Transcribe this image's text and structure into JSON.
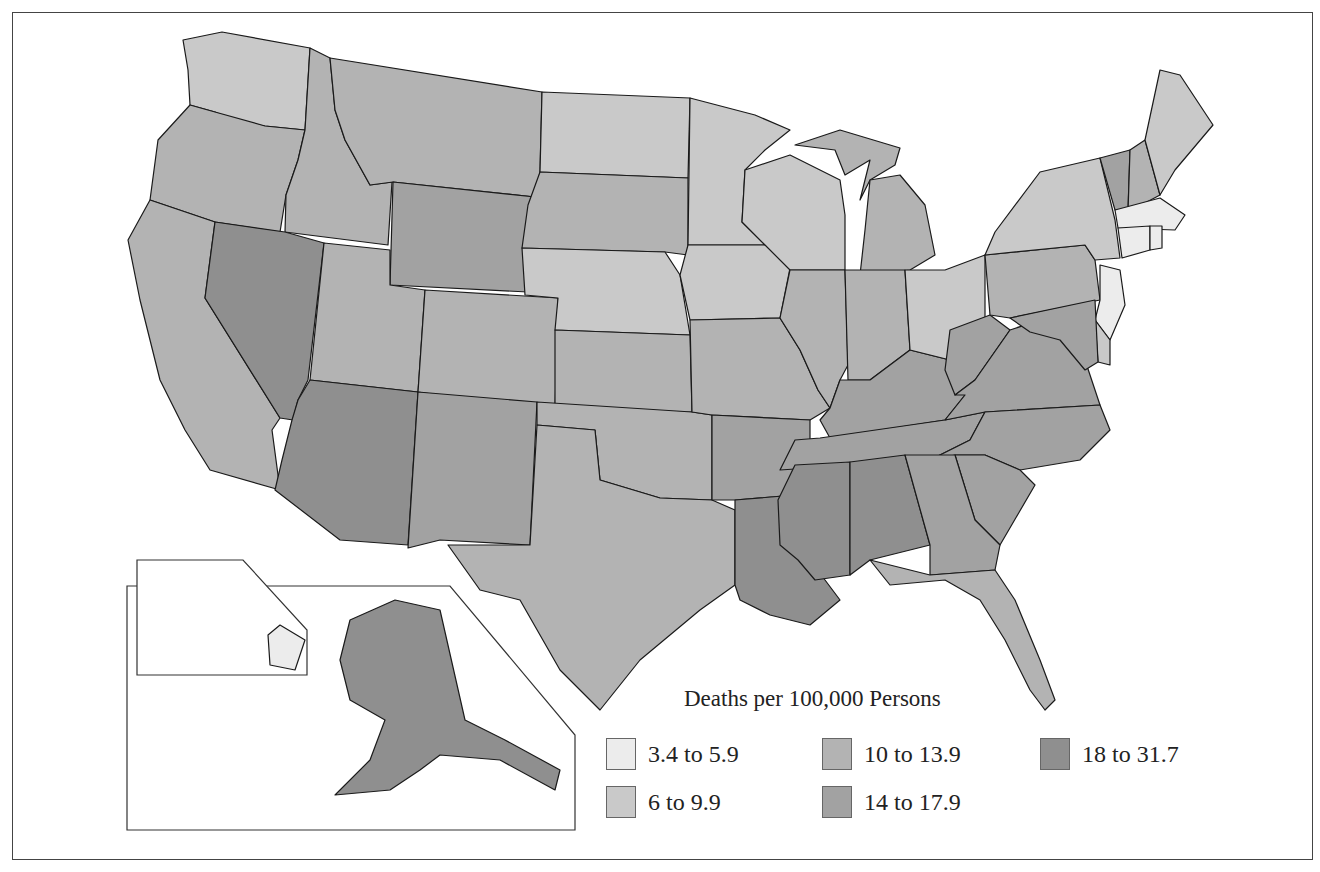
{
  "chart_data": {
    "type": "choropleth",
    "title": "Deaths per 100,000 Persons",
    "legend": {
      "title": "Deaths per 100,000 Persons",
      "bins": [
        {
          "id": "b1",
          "label": "3.4 to 5.9",
          "min": 3.4,
          "max": 5.9,
          "color": "#ececec"
        },
        {
          "id": "b2",
          "label": "6 to 9.9",
          "min": 6,
          "max": 9.9,
          "color": "#c9c9c9"
        },
        {
          "id": "b3",
          "label": "10 to 13.9",
          "min": 10,
          "max": 13.9,
          "color": "#b3b3b3"
        },
        {
          "id": "b4",
          "label": "14 to 17.9",
          "min": 14,
          "max": 17.9,
          "color": "#a2a2a2"
        },
        {
          "id": "b5",
          "label": "18 to 31.7",
          "min": 18,
          "max": 31.7,
          "color": "#8f8f8f"
        }
      ]
    },
    "states": {
      "WA": "b2",
      "OR": "b3",
      "CA": "b3",
      "ID": "b3",
      "NV": "b5",
      "MT": "b3",
      "WY": "b4",
      "UT": "b3",
      "AZ": "b5",
      "CO": "b3",
      "NM": "b4",
      "ND": "b2",
      "SD": "b3",
      "NE": "b2",
      "KS": "b3",
      "OK": "b3",
      "TX": "b3",
      "MN": "b2",
      "IA": "b2",
      "MO": "b3",
      "AR": "b4",
      "LA": "b5",
      "WI": "b2",
      "IL": "b3",
      "MS": "b5",
      "MI": "b3",
      "IN": "b3",
      "KY": "b4",
      "TN": "b4",
      "AL": "b5",
      "OH": "b2",
      "WV": "b4",
      "VA": "b4",
      "NC": "b4",
      "SC": "b4",
      "GA": "b4",
      "FL": "b3",
      "PA": "b3",
      "NY": "b2",
      "VT": "b4",
      "NH": "b3",
      "ME": "b2",
      "MA": "b1",
      "RI": "b1",
      "CT": "b1",
      "NJ": "b1",
      "DE": "b2",
      "MD": "b4",
      "AK": "b5",
      "HI": "b1"
    }
  }
}
